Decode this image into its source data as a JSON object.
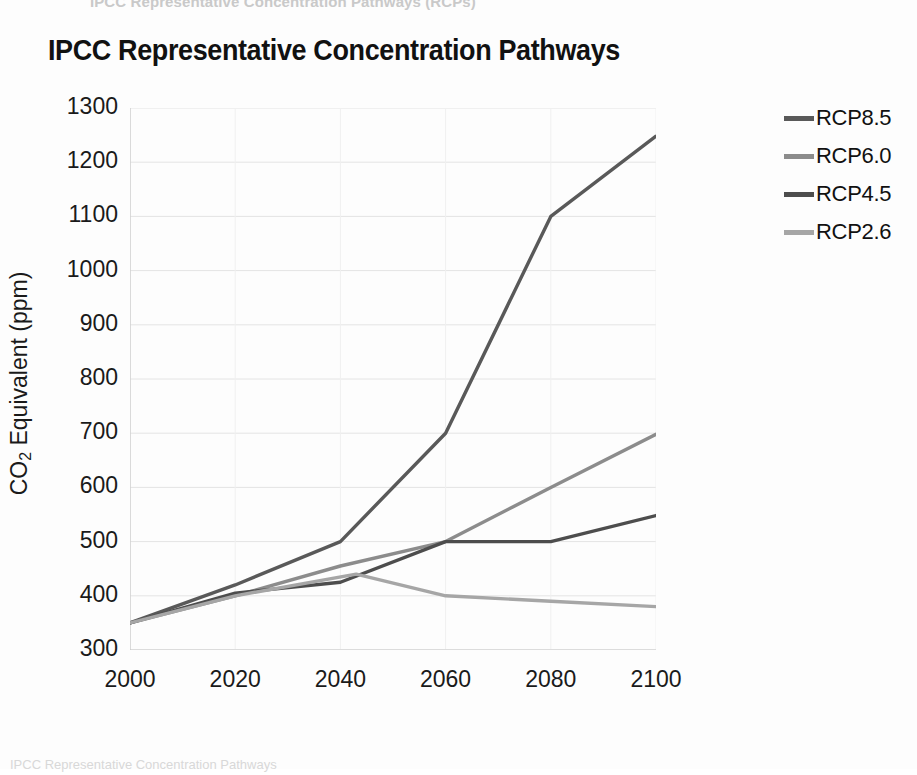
{
  "page": {
    "top_cropped_text": "IPCC Representative Concentration Pathways (RCPs)",
    "bottom_cropped_text": "IPCC Representative Concentration Pathways"
  },
  "chart_data": {
    "type": "line",
    "title": "IPCC Representative Concentration Pathways",
    "xlabel": "",
    "ylabel": "CO2 Equivalent (ppm)",
    "ylabel_main": "CO",
    "ylabel_sub": "2",
    "ylabel_rest": " Equivalent (ppm)",
    "xlim": [
      2000,
      2100
    ],
    "ylim": [
      300,
      1300
    ],
    "xticks": [
      2000,
      2020,
      2040,
      2060,
      2080,
      2100
    ],
    "yticks": [
      300,
      400,
      500,
      600,
      700,
      800,
      900,
      1000,
      1100,
      1200,
      1300
    ],
    "grid": true,
    "minor_ticks": true,
    "legend_position": "right",
    "series": [
      {
        "name": "RCP8.5",
        "color": "#595959",
        "x": [
          2000,
          2020,
          2040,
          2060,
          2080,
          2100
        ],
        "values": [
          350,
          420,
          500,
          700,
          1100,
          1248
        ]
      },
      {
        "name": "RCP6.0",
        "color": "#8c8c8c",
        "x": [
          2000,
          2020,
          2040,
          2060,
          2080,
          2100
        ],
        "values": [
          350,
          400,
          455,
          500,
          600,
          698
        ]
      },
      {
        "name": "RCP4.5",
        "color": "#4d4d4d",
        "x": [
          2000,
          2020,
          2040,
          2060,
          2080,
          2100
        ],
        "values": [
          350,
          405,
          425,
          500,
          500,
          548
        ]
      },
      {
        "name": "RCP2.6",
        "color": "#a6a6a6",
        "x": [
          2000,
          2020,
          2043,
          2060,
          2080,
          2100
        ],
        "values": [
          350,
          400,
          440,
          400,
          390,
          380
        ]
      }
    ]
  }
}
